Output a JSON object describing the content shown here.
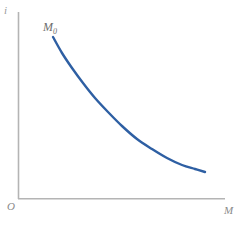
{
  "figure": {
    "background_color": "#ffffff",
    "width": 243,
    "height": 226
  },
  "axes": {
    "color": "#b4b4b4",
    "y_axis_label": "i",
    "x_axis_label": "M",
    "origin_label": "O"
  },
  "annotations": {
    "curve_start_label_base": "M",
    "curve_start_label_subscript": "0"
  },
  "chart_data": {
    "type": "line",
    "title": "",
    "xlabel": "M",
    "ylabel": "i",
    "grid": false,
    "legend": null,
    "curve_color": "#2e5fa3",
    "curve_width": 2.4,
    "origin_label": "O",
    "annotations": [
      {
        "text": "M0",
        "display": "M₀",
        "x_px": 53,
        "y_px": 37,
        "position": "above-left-of-curve-start"
      }
    ],
    "axis_pixel_extent": {
      "x_axis_from": [
        18,
        199
      ],
      "x_axis_to": [
        225,
        199
      ],
      "y_axis_from": [
        18,
        12
      ],
      "y_axis_to": [
        18,
        199
      ]
    },
    "series": [
      {
        "name": "money-demand",
        "description": "convex downward-sloping curve",
        "points_px": [
          [
            53,
            37
          ],
          [
            62,
            53
          ],
          [
            72,
            68
          ],
          [
            83,
            83
          ],
          [
            95,
            98
          ],
          [
            108,
            112
          ],
          [
            122,
            126
          ],
          [
            137,
            139
          ],
          [
            152,
            149
          ],
          [
            167,
            158
          ],
          [
            182,
            165
          ],
          [
            195,
            169
          ],
          [
            205,
            172
          ]
        ],
        "x_normalized": [
          0.169,
          0.213,
          0.261,
          0.314,
          0.372,
          0.435,
          0.502,
          0.575,
          0.647,
          0.72,
          0.792,
          0.855,
          0.903
        ],
        "y_normalized": [
          0.866,
          0.781,
          0.701,
          0.62,
          0.54,
          0.465,
          0.39,
          0.321,
          0.267,
          0.219,
          0.182,
          0.16,
          0.144
        ]
      }
    ],
    "xlim": [
      0,
      1
    ],
    "ylim": [
      0,
      1
    ]
  }
}
